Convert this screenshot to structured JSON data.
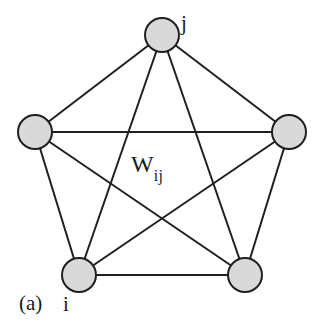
{
  "figure": {
    "caption_label": "(a)",
    "background_color": "#ffffff",
    "width": 322,
    "height": 329
  },
  "diagram": {
    "type": "fully-connected-graph",
    "node_count": 5,
    "edge_count": 10,
    "node_fill_color": "#d9d9d9",
    "node_stroke_color": "#1f1f1f",
    "edge_color": "#1f1f1f",
    "edge_width": 2,
    "node_radius": 17,
    "nodes": [
      {
        "id": "top",
        "label": "j",
        "cx": 162,
        "cy": 35,
        "r": 17
      },
      {
        "id": "left",
        "label": "",
        "cx": 35,
        "cy": 132,
        "r": 17
      },
      {
        "id": "right",
        "label": "",
        "cx": 289,
        "cy": 132,
        "r": 17
      },
      {
        "id": "bottom-left",
        "label": "i",
        "cx": 79,
        "cy": 275,
        "r": 17
      },
      {
        "id": "bottom-right",
        "label": "",
        "cx": 245,
        "cy": 275,
        "r": 17
      }
    ],
    "edges": [
      {
        "from": "top",
        "to": "left"
      },
      {
        "from": "top",
        "to": "right"
      },
      {
        "from": "top",
        "to": "bottom-left"
      },
      {
        "from": "top",
        "to": "bottom-right"
      },
      {
        "from": "left",
        "to": "right"
      },
      {
        "from": "left",
        "to": "bottom-left"
      },
      {
        "from": "left",
        "to": "bottom-right"
      },
      {
        "from": "right",
        "to": "bottom-left"
      },
      {
        "from": "right",
        "to": "bottom-right"
      },
      {
        "from": "bottom-left",
        "to": "bottom-right"
      }
    ]
  },
  "labels": {
    "node_j": "j",
    "node_i": "i",
    "weight_base": "W",
    "weight_subscript": "ij",
    "weight_full": "W ij"
  }
}
